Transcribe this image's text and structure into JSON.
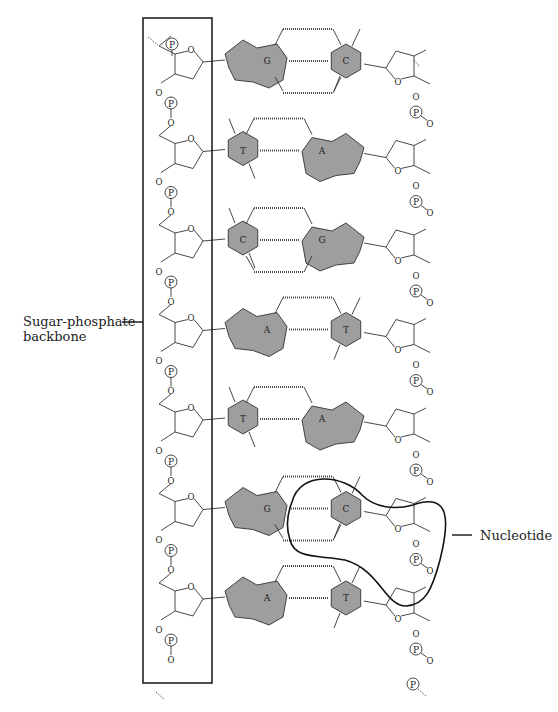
{
  "figure": {
    "colors": {
      "base_fill": "#9e9e9e",
      "line": "#333333",
      "box": "#222222",
      "background": "#ffffff"
    },
    "labels": {
      "backbone": "Sugar-phosphate\nbackbone",
      "nucleotide": "Nucleotide"
    },
    "symbols": {
      "phosphate": "P",
      "oxygen": "O"
    },
    "base_pairs": [
      {
        "left": "G",
        "right": "C"
      },
      {
        "left": "T",
        "right": "A"
      },
      {
        "left": "C",
        "right": "G"
      },
      {
        "left": "A",
        "right": "T"
      },
      {
        "left": "T",
        "right": "A"
      },
      {
        "left": "G",
        "right": "C"
      },
      {
        "left": "A",
        "right": "T"
      }
    ],
    "highlighted_nucleotide_index": 5
  }
}
